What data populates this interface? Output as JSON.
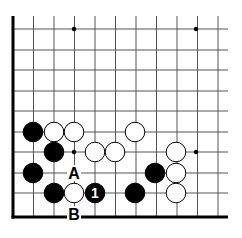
{
  "board": {
    "x0": 13,
    "y0": 16,
    "step": 20.5,
    "cols": 11,
    "rows": 10,
    "right_edge": 228,
    "line_color": "#000000",
    "star_points": [
      [
        3,
        0.65
      ],
      [
        9,
        0.65
      ],
      [
        3,
        6.55
      ],
      [
        9,
        6.55
      ]
    ]
  },
  "stones": [
    {
      "color": "black",
      "x": 33,
      "y": 132
    },
    {
      "color": "white",
      "x": 54,
      "y": 132
    },
    {
      "color": "white",
      "x": 74,
      "y": 132
    },
    {
      "color": "white",
      "x": 135,
      "y": 132
    },
    {
      "color": "black",
      "x": 54,
      "y": 152
    },
    {
      "color": "white",
      "x": 95,
      "y": 152
    },
    {
      "color": "white",
      "x": 115,
      "y": 152
    },
    {
      "color": "white",
      "x": 176,
      "y": 152
    },
    {
      "color": "black",
      "x": 33,
      "y": 173
    },
    {
      "color": "black",
      "x": 155,
      "y": 173
    },
    {
      "color": "white",
      "x": 176,
      "y": 173
    },
    {
      "color": "black",
      "x": 54,
      "y": 193
    },
    {
      "color": "white",
      "x": 74,
      "y": 193
    },
    {
      "color": "black",
      "x": 95,
      "y": 193,
      "label": "1"
    },
    {
      "color": "black",
      "x": 135,
      "y": 193
    },
    {
      "color": "white",
      "x": 176,
      "y": 193
    }
  ],
  "labels": [
    {
      "text": "A",
      "x": 74,
      "y": 173
    },
    {
      "text": "B",
      "x": 74,
      "y": 214
    }
  ]
}
